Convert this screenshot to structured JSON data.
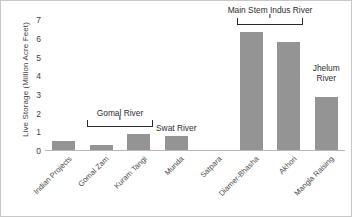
{
  "chart_data": {
    "type": "bar",
    "title": "",
    "xlabel": "",
    "ylabel": "Live Storage (Million Acre Feet)",
    "ylim": [
      0,
      7.4
    ],
    "yticks": [
      0,
      1,
      2,
      3,
      4,
      5,
      6,
      7
    ],
    "grid": false,
    "legend": "none",
    "bar_color": "#949494",
    "categories": [
      "Indian Projects",
      "Gomal Zam",
      "Kuram Tangi",
      "Munda",
      "Satpara",
      "Diamer-Bhasha",
      "Akhori",
      "Mangla Raising"
    ],
    "values": [
      0.55,
      0.33,
      0.9,
      0.8,
      0.05,
      6.4,
      5.85,
      2.9
    ],
    "annotations": [
      {
        "label": "Gomal River",
        "type": "bracket",
        "spans": [
          "Gomal Zam",
          "Kuram Tangi"
        ]
      },
      {
        "label": "Swat River",
        "type": "text",
        "spans": [
          "Munda"
        ]
      },
      {
        "label": "Main Stem Indus River",
        "type": "bracket",
        "spans": [
          "Diamer-Bhasha",
          "Akhori"
        ]
      },
      {
        "label": "Jhelum River",
        "type": "text",
        "spans": [
          "Mangla Raising"
        ]
      }
    ]
  },
  "axis": {
    "y_title": "Live Storage (Million Acre Feet)",
    "y_tick_labels": [
      "7",
      "6",
      "5",
      "4",
      "3",
      "2",
      "1",
      "0"
    ]
  },
  "annotations": {
    "gomal": "Gomal River",
    "swat": "Swat River",
    "indus": "Main Stem Indus River",
    "jhelum_line1": "Jhelum",
    "jhelum_line2": "River"
  }
}
